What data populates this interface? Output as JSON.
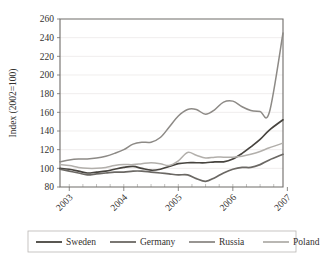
{
  "chart_data": {
    "type": "line",
    "title": "",
    "xlabel": "",
    "ylabel": "Index (2002=100)",
    "ylim": [
      80,
      260
    ],
    "ytick_step": 20,
    "yticks": [
      80,
      100,
      120,
      140,
      160,
      180,
      200,
      220,
      240,
      260
    ],
    "xlim": [
      2002.83,
      2006.92
    ],
    "xticks": [
      2003,
      2004,
      2005,
      2006,
      2007
    ],
    "xtick_labels": [
      "2003",
      "2004",
      "2005",
      "2006",
      "2007"
    ],
    "xtick_rotation_deg": 45,
    "minor_ticks_per_year": 4,
    "grid": "horizontal",
    "legend_position": "bottom",
    "x": [
      2002.83,
      2003.0,
      2003.17,
      2003.33,
      2003.5,
      2003.67,
      2003.83,
      2004.0,
      2004.17,
      2004.33,
      2004.5,
      2004.67,
      2004.83,
      2005.0,
      2005.17,
      2005.33,
      2005.5,
      2005.67,
      2005.83,
      2006.0,
      2006.17,
      2006.33,
      2006.5,
      2006.67,
      2006.92
    ],
    "series": [
      {
        "name": "Sweden",
        "color": "#47443f",
        "width": 1.7,
        "values": [
          100,
          99,
          97,
          95,
          96,
          97,
          99,
          101,
          102,
          100,
          98,
          99,
          102,
          105,
          106,
          106,
          106,
          107,
          107,
          110,
          116,
          123,
          131,
          141,
          152
        ]
      },
      {
        "name": "Germany",
        "color": "#6b6864",
        "width": 1.7,
        "values": [
          99,
          97,
          95,
          93,
          94,
          95,
          96,
          96,
          97,
          97,
          96,
          95,
          94,
          93,
          93,
          89,
          86,
          90,
          95,
          99,
          101,
          101,
          104,
          109,
          115
        ]
      },
      {
        "name": "Russia",
        "color": "#8d8a86",
        "width": 1.5,
        "values": [
          107,
          109,
          110,
          110,
          111,
          113,
          116,
          120,
          126,
          128,
          128,
          133,
          144,
          156,
          163,
          163,
          158,
          163,
          171,
          172,
          166,
          162,
          161,
          160,
          245
        ]
      },
      {
        "name": "Poland",
        "color": "#b2afab",
        "width": 1.5,
        "values": [
          104,
          103,
          101,
          100,
          100,
          101,
          103,
          104,
          104,
          105,
          106,
          105,
          103,
          108,
          117,
          114,
          111,
          112,
          112,
          112,
          113,
          115,
          118,
          122,
          127
        ]
      }
    ],
    "legend_entries": [
      {
        "label": "Sweden",
        "color": "#47443f"
      },
      {
        "label": "Germany",
        "color": "#6b6864"
      },
      {
        "label": "Russia",
        "color": "#8d8a86"
      },
      {
        "label": "Poland",
        "color": "#b2afab"
      }
    ]
  }
}
